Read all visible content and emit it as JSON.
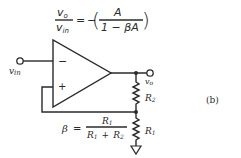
{
  "figure": {
    "label": "(b)",
    "gain_equation": {
      "lhs_numerator": "v",
      "lhs_numerator_sub": "o",
      "lhs_denominator": "v",
      "lhs_denominator_sub": "in",
      "equals": "=",
      "minus": "−",
      "open_paren": "(",
      "close_paren": ")",
      "rhs_numerator": "A",
      "rhs_denominator": "1 − βA"
    },
    "beta_equation": {
      "lhs": "β",
      "equals": "=",
      "numerator": "R",
      "numerator_sub": "1",
      "denominator_a": "R",
      "denominator_a_sub": "1",
      "denominator_plus": "+",
      "denominator_b": "R",
      "denominator_b_sub": "2"
    },
    "opamp": {
      "inverting_symbol": "−",
      "noninverting_symbol": "+"
    },
    "terminals": {
      "input_label": "v",
      "input_label_sub": "in",
      "output_label": "v",
      "output_label_sub": "o"
    },
    "resistors": [
      {
        "name": "R",
        "sub": "2"
      },
      {
        "name": "R",
        "sub": "1"
      }
    ],
    "colors": {
      "ink": "#2a2a2a",
      "background": "#ffffff"
    }
  }
}
